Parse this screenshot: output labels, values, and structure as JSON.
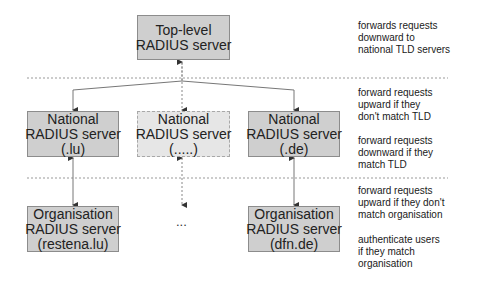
{
  "diagram": {
    "type": "hierarchy",
    "colors": {
      "box_fill": "#cfcfcf",
      "box_border": "#8c8c8c",
      "placeholder_fill": "#e6e6e6",
      "line": "#777777",
      "separator": "#999999"
    },
    "levels": [
      {
        "id": "top",
        "nodes": [
          {
            "id": "top-level",
            "lines": [
              "Top-level",
              "RADIUS server"
            ]
          }
        ],
        "description": [
          "forwards requests",
          "downward to",
          "national TLD servers"
        ]
      },
      {
        "id": "national",
        "nodes": [
          {
            "id": "national-lu",
            "lines": [
              "National",
              "RADIUS server",
              "(.lu)"
            ]
          },
          {
            "id": "national-generic",
            "lines": [
              "National",
              "RADIUS server",
              "(.....)"
            ],
            "placeholder": true
          },
          {
            "id": "national-de",
            "lines": [
              "National",
              "RADIUS server",
              "(.de)"
            ]
          }
        ],
        "description_up": [
          "forward requests",
          "upward if they",
          "don't match TLD"
        ],
        "description_down": [
          "forward requests",
          "downward if they",
          "match TLD"
        ]
      },
      {
        "id": "organisation",
        "nodes": [
          {
            "id": "org-restena",
            "lines": [
              "Organisation",
              "RADIUS server",
              "(restena.lu)"
            ]
          },
          {
            "id": "org-ellipsis",
            "text": "..."
          },
          {
            "id": "org-dfn",
            "lines": [
              "Organisation",
              "RADIUS server",
              "(dfn.de)"
            ]
          }
        ],
        "description_up": [
          "forward requests",
          "upward if they don't",
          "match organisation"
        ],
        "description_down": [
          "authenticate users",
          "if they match",
          "organisation"
        ]
      }
    ],
    "edges": [
      {
        "from": "top-level",
        "to": "national-lu",
        "bidirectional": true
      },
      {
        "from": "top-level",
        "to": "national-generic",
        "bidirectional": true,
        "dashed": true
      },
      {
        "from": "top-level",
        "to": "national-de",
        "bidirectional": true
      },
      {
        "from": "national-lu",
        "to": "org-restena",
        "bidirectional": true
      },
      {
        "from": "national-generic",
        "to": "org-ellipsis",
        "bidirectional": true,
        "dashed": true
      },
      {
        "from": "national-de",
        "to": "org-dfn",
        "bidirectional": true
      }
    ]
  }
}
